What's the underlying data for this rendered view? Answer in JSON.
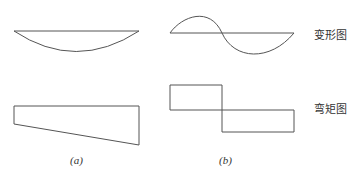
{
  "labels": {
    "deformation": "变形图",
    "moment": "弯矩图"
  },
  "captions": {
    "a": "(a)",
    "b": "(b)"
  },
  "colors": {
    "stroke": "#555555",
    "background": "#ffffff"
  }
}
